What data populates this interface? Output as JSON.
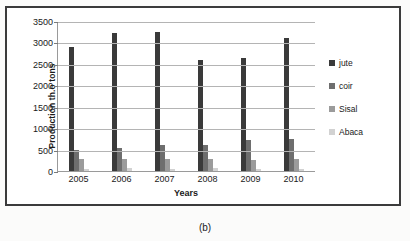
{
  "caption": "(b)",
  "legend": {
    "position": "right",
    "entries": [
      "jute",
      "coir",
      "Sisal",
      "Abaca"
    ]
  },
  "colors": {
    "jute": "#3a3a3a",
    "coir": "#6e6e6e",
    "sisal": "#9b9b9b",
    "abaca": "#d2d2d2",
    "gridline": "#b4b4b4",
    "frame": "#3b3b3b",
    "text": "#1a1a1a"
  },
  "chart_data": {
    "type": "bar",
    "title": "",
    "xlabel": "Years",
    "ylabel": "Production th.o tons",
    "categories": [
      "2005",
      "2006",
      "2007",
      "2008",
      "2009",
      "2010"
    ],
    "series": [
      {
        "name": "jute",
        "values": [
          2900,
          3220,
          3240,
          2590,
          2640,
          3100
        ]
      },
      {
        "name": "coir",
        "values": [
          500,
          540,
          600,
          610,
          730,
          750
        ]
      },
      {
        "name": "Sisal",
        "values": [
          280,
          290,
          280,
          270,
          265,
          270
        ]
      },
      {
        "name": "Abaca",
        "values": [
          40,
          60,
          45,
          75,
          50,
          45
        ]
      }
    ],
    "ylim": [
      0,
      3500
    ],
    "ytick_values": [
      0,
      500,
      1000,
      1500,
      2000,
      2500,
      3000,
      3500
    ],
    "ytick_labels": [
      "0",
      "500",
      "1000",
      "1500",
      "2000",
      "2500",
      "3000",
      "3500"
    ],
    "grid": true,
    "legend_position": "right"
  }
}
